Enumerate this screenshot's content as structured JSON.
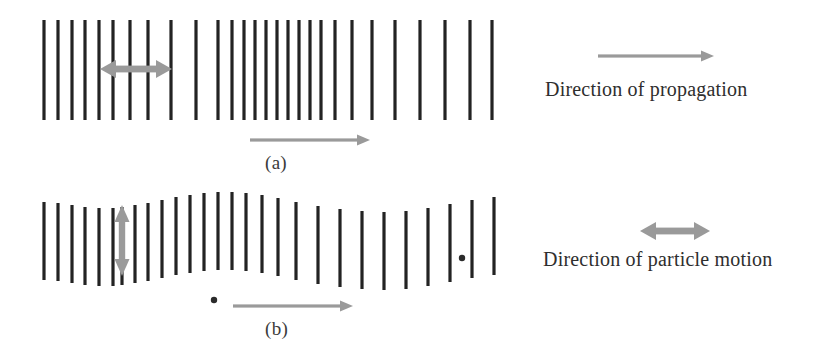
{
  "figure": {
    "width": 826,
    "height": 353,
    "background": "#ffffff",
    "line_color": "#232323",
    "arrow_color": "#9a9a9a",
    "dot_color": "#2b2b2b",
    "text_color": "#2e2e2e"
  },
  "panels": [
    {
      "id": "a",
      "label": "(a)",
      "wave_type": "longitudinal",
      "description": "Longitudinal wave: vertical lines bunched into compressions and spread into rarefactions",
      "label_x": 265,
      "label_y": 152,
      "line_top": 20,
      "line_bottom": 120,
      "line_count": 28,
      "line_x_positions": [
        44,
        58,
        72,
        85,
        99,
        113,
        130,
        148,
        171,
        196,
        218,
        232,
        244,
        255,
        266,
        277,
        288,
        299,
        310,
        321,
        335,
        352,
        372,
        395,
        420,
        445,
        470,
        492
      ],
      "motion_arrow": {
        "type": "double-horizontal",
        "x1": 100,
        "x2": 172,
        "y": 69,
        "label_role": "particle-motion-indicator"
      },
      "propagation_arrow": {
        "type": "single-right",
        "x1": 250,
        "x2": 370,
        "y": 140
      }
    },
    {
      "id": "b",
      "label": "(b)",
      "wave_type": "transverse",
      "description": "Transverse wave: vertical lines displaced up and down in a sinusoidal pattern",
      "label_x": 265,
      "label_y": 318,
      "line_top": 202,
      "line_bottom": 280,
      "line_count": 28,
      "line_x_positions": [
        44,
        58,
        72,
        85,
        99,
        113,
        122,
        135,
        148,
        162,
        176,
        190,
        204,
        218,
        232,
        246,
        262,
        278,
        296,
        318,
        340,
        362,
        384,
        406,
        428,
        450,
        472,
        494
      ],
      "line_y_offsets": [
        0,
        1,
        3,
        5,
        6,
        6,
        5,
        3,
        1,
        -2,
        -5,
        -7,
        -9,
        -10,
        -10,
        -9,
        -7,
        -4,
        0,
        4,
        7,
        9,
        10,
        9,
        6,
        2,
        -2,
        -5
      ],
      "motion_arrow": {
        "type": "double-vertical",
        "x": 122,
        "y1": 205,
        "y2": 276
      },
      "propagation_arrow": {
        "type": "single-right",
        "x1": 233,
        "x2": 353,
        "y": 306
      },
      "dots": [
        {
          "name": "particle-marker-right",
          "cx": 462,
          "cy": 258,
          "r": 3.2
        },
        {
          "name": "particle-marker-left",
          "cx": 214,
          "cy": 300,
          "r": 3.2
        }
      ]
    }
  ],
  "legend": [
    {
      "id": "propagation",
      "text": "Direction of propagation",
      "arrow_type": "single-right",
      "text_x": 545,
      "text_y": 95,
      "arrow_x1": 598,
      "arrow_x2": 714,
      "arrow_y": 56
    },
    {
      "id": "particle-motion",
      "text": "Direction of particle motion",
      "arrow_type": "double-horizontal",
      "text_x": 543,
      "text_y": 265,
      "arrow_x1": 640,
      "arrow_x2": 710,
      "arrow_y": 231
    }
  ]
}
